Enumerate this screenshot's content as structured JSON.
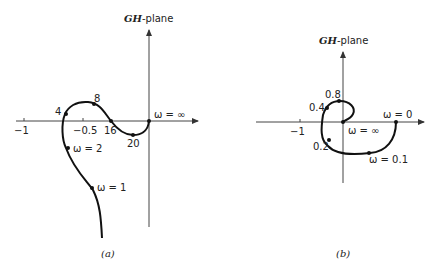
{
  "panel_a": {
    "plane_title_italic": "GH",
    "plane_title_rest": "-plane",
    "tick_labels": [
      "−1",
      "−0.5"
    ],
    "point_labels": {
      "w_inf": "ω = ∞",
      "p4": "4",
      "p8": "8",
      "p16": "16",
      "p20": "20",
      "w2": "ω = 2",
      "w1": "ω = 1"
    },
    "caption": "(a)"
  },
  "panel_b": {
    "plane_title_italic": "GH",
    "plane_title_rest": "-plane",
    "tick_labels": [
      "−1"
    ],
    "point_labels": {
      "w0": "ω = 0",
      "w_inf": "ω = ∞",
      "p08": "0.8",
      "p04": "0.4",
      "p02": "0.2",
      "w01": "ω = 0.1"
    },
    "caption": "(b)"
  }
}
